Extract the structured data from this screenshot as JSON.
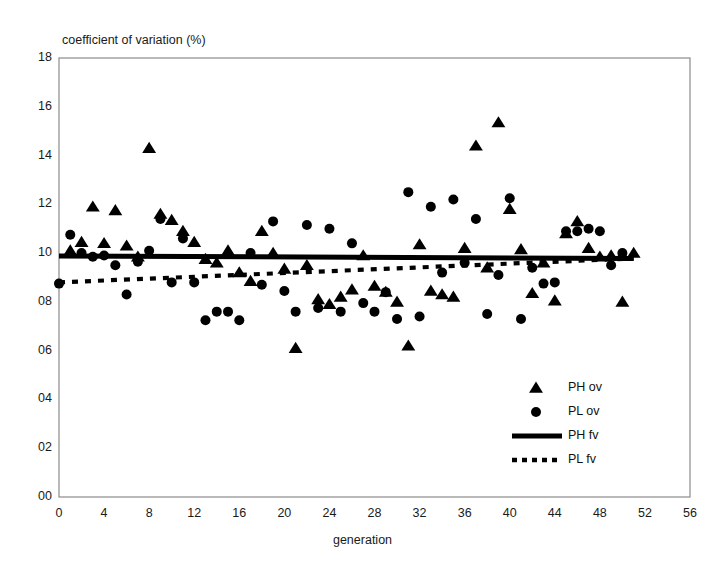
{
  "chart_data": {
    "type": "scatter",
    "title": "",
    "xlabel": "generation",
    "ylabel": "coefficient of variation (%)",
    "xlim": [
      0,
      56
    ],
    "ylim": [
      0,
      18
    ],
    "xticks": [
      "0",
      "4",
      "8",
      "12",
      "16",
      "20",
      "24",
      "28",
      "32",
      "36",
      "40",
      "44",
      "48",
      "52",
      "56"
    ],
    "xtick_values": [
      0,
      4,
      8,
      12,
      16,
      20,
      24,
      28,
      32,
      36,
      40,
      44,
      48,
      52,
      56
    ],
    "yticks": [
      "00",
      "02",
      "04",
      "06",
      "08",
      "10",
      "12",
      "14",
      "16",
      "18"
    ],
    "ytick_values": [
      0,
      2,
      4,
      6,
      8,
      10,
      12,
      14,
      16,
      18
    ],
    "grid": false,
    "legend_position": "inside-lower-right",
    "series": [
      {
        "name": "PH ov",
        "marker": "triangle",
        "color": "#000000",
        "points": [
          [
            1,
            10.1
          ],
          [
            2,
            10.45
          ],
          [
            3,
            11.9
          ],
          [
            4,
            10.4
          ],
          [
            5,
            11.75
          ],
          [
            6,
            10.3
          ],
          [
            7,
            9.85
          ],
          [
            8,
            14.3
          ],
          [
            9,
            11.6
          ],
          [
            10,
            11.35
          ],
          [
            11,
            10.9
          ],
          [
            12,
            10.45
          ],
          [
            13,
            9.75
          ],
          [
            14,
            9.6
          ],
          [
            15,
            10.1
          ],
          [
            16,
            9.2
          ],
          [
            17,
            8.85
          ],
          [
            18,
            10.9
          ],
          [
            19,
            10.0
          ],
          [
            20,
            9.35
          ],
          [
            21,
            6.1
          ],
          [
            22,
            9.5
          ],
          [
            23,
            8.1
          ],
          [
            24,
            7.9
          ],
          [
            25,
            8.2
          ],
          [
            26,
            8.5
          ],
          [
            27,
            9.9
          ],
          [
            28,
            8.65
          ],
          [
            29,
            8.4
          ],
          [
            30,
            8.0
          ],
          [
            31,
            6.2
          ],
          [
            32,
            10.35
          ],
          [
            33,
            8.45
          ],
          [
            34,
            8.3
          ],
          [
            35,
            8.2
          ],
          [
            36,
            10.2
          ],
          [
            37,
            14.4
          ],
          [
            38,
            9.4
          ],
          [
            39,
            15.35
          ],
          [
            40,
            11.8
          ],
          [
            41,
            10.15
          ],
          [
            42,
            8.35
          ],
          [
            43,
            9.6
          ],
          [
            44,
            8.05
          ],
          [
            45,
            10.8
          ],
          [
            46,
            11.3
          ],
          [
            47,
            10.2
          ],
          [
            48,
            9.85
          ],
          [
            49,
            9.9
          ],
          [
            50,
            8.0
          ],
          [
            51,
            10.0
          ]
        ]
      },
      {
        "name": "PL ov",
        "marker": "circle",
        "color": "#000000",
        "points": [
          [
            0,
            8.75
          ],
          [
            1,
            10.75
          ],
          [
            2,
            10.0
          ],
          [
            3,
            9.85
          ],
          [
            4,
            9.9
          ],
          [
            5,
            9.5
          ],
          [
            6,
            8.3
          ],
          [
            7,
            9.65
          ],
          [
            8,
            10.1
          ],
          [
            9,
            11.4
          ],
          [
            10,
            8.8
          ],
          [
            11,
            10.6
          ],
          [
            12,
            8.8
          ],
          [
            13,
            7.25
          ],
          [
            14,
            7.6
          ],
          [
            15,
            7.6
          ],
          [
            16,
            7.25
          ],
          [
            17,
            10.0
          ],
          [
            18,
            8.7
          ],
          [
            19,
            11.3
          ],
          [
            20,
            8.45
          ],
          [
            21,
            7.6
          ],
          [
            22,
            11.15
          ],
          [
            23,
            7.75
          ],
          [
            24,
            11.0
          ],
          [
            25,
            7.6
          ],
          [
            26,
            10.4
          ],
          [
            27,
            7.95
          ],
          [
            28,
            7.6
          ],
          [
            29,
            8.4
          ],
          [
            30,
            7.3
          ],
          [
            31,
            12.5
          ],
          [
            32,
            7.4
          ],
          [
            33,
            11.9
          ],
          [
            34,
            9.2
          ],
          [
            35,
            12.2
          ],
          [
            36,
            9.6
          ],
          [
            37,
            11.4
          ],
          [
            38,
            7.5
          ],
          [
            39,
            9.1
          ],
          [
            40,
            12.25
          ],
          [
            41,
            7.3
          ],
          [
            42,
            9.4
          ],
          [
            43,
            8.75
          ],
          [
            44,
            8.8
          ],
          [
            45,
            10.9
          ],
          [
            46,
            10.9
          ],
          [
            47,
            11.0
          ],
          [
            48,
            10.9
          ],
          [
            49,
            9.5
          ],
          [
            50,
            10.0
          ]
        ]
      }
    ],
    "fit_lines": [
      {
        "name": "PH fv",
        "style": "solid",
        "color": "#000000",
        "x": [
          0,
          51
        ],
        "y": [
          9.88,
          9.78
        ]
      },
      {
        "name": "PL fv",
        "style": "dotted",
        "color": "#000000",
        "x": [
          0,
          51
        ],
        "y": [
          8.8,
          9.78
        ]
      }
    ],
    "legend": [
      {
        "label": "PH ov",
        "marker": "triangle"
      },
      {
        "label": "PL ov",
        "marker": "circle"
      },
      {
        "label": "PH fv",
        "marker": "solid-line"
      },
      {
        "label": "PL fv",
        "marker": "dotted-line"
      }
    ]
  }
}
